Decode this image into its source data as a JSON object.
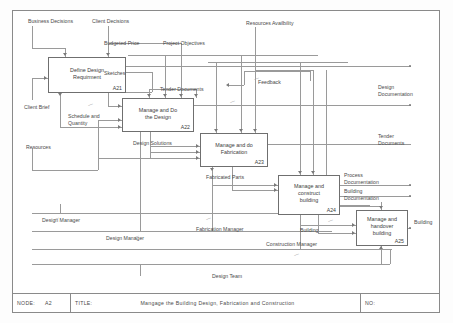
{
  "diagram": {
    "type": "idef0",
    "title": "Mangage the Building Design, Fabrication and Construction",
    "node": "A2",
    "node_label": "NODE:",
    "title_label": "TITLE:",
    "number_label": "NO:",
    "boxes": [
      {
        "id": "A21",
        "label": "Define Design\nRequirment",
        "code": "A21"
      },
      {
        "id": "A22",
        "label": "Manage and Do\nthe Design",
        "code": "A22"
      },
      {
        "id": "A23",
        "label": "Manage and do\nFabrication",
        "code": "A23"
      },
      {
        "id": "A24",
        "label": "Manage and\nconstruct\nbuilding",
        "code": "A24"
      },
      {
        "id": "A25",
        "label": "Manage and\nhandover\nbuilding",
        "code": "A25"
      }
    ],
    "arrows": [
      {
        "name": "business-decisions",
        "label": "Business Decisions"
      },
      {
        "name": "client-decisions",
        "label": "Client Decisions"
      },
      {
        "name": "budgeted-price",
        "label": "Budgeted Price"
      },
      {
        "name": "project-objectives",
        "label": "Project Objectives"
      },
      {
        "name": "resources-availbility",
        "label": "Resources Availbility"
      },
      {
        "name": "client-brief",
        "label": "Client Brief"
      },
      {
        "name": "resources",
        "label": "Resources"
      },
      {
        "name": "sketches",
        "label": "Sketches"
      },
      {
        "name": "schedule-and-quantity",
        "label": "Schedule and\nQuantity"
      },
      {
        "name": "tender-documents-int",
        "label": "Tender Documents"
      },
      {
        "name": "feedback",
        "label": "Feedback"
      },
      {
        "name": "design-solutions",
        "label": "Design Solutions"
      },
      {
        "name": "fabricated-parts",
        "label": "Fabricated Parts"
      },
      {
        "name": "building-internal",
        "label": "Building"
      },
      {
        "name": "design-manager-1",
        "label": "Design Manager"
      },
      {
        "name": "design-manager-2",
        "label": "Design Manager"
      },
      {
        "name": "fabrication-manager",
        "label": "Fabrication Manager"
      },
      {
        "name": "construction-manager",
        "label": "Construction Manager"
      },
      {
        "name": "design-team",
        "label": "Design Team"
      }
    ],
    "outputs": [
      {
        "name": "design-documentation",
        "label": "Design\nDocumentation"
      },
      {
        "name": "tender-documents-out",
        "label": "Tender\nDocuments"
      },
      {
        "name": "process-documentation",
        "label": "Process\nDocumentation"
      },
      {
        "name": "building-documentation",
        "label": "Building\nDocumentation"
      },
      {
        "name": "building-out",
        "label": "Building"
      }
    ],
    "colors": {
      "line": "#9a9a9a",
      "box_border": "#6f6f6f",
      "text": "#4a4a4a",
      "frame": "#8a8a8a",
      "background": "#ffffff"
    }
  }
}
